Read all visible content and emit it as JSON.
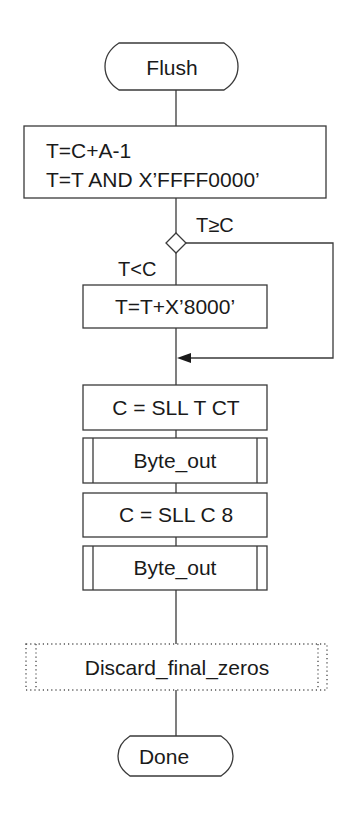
{
  "flowchart": {
    "start": {
      "label": "Flush",
      "shape": "terminator"
    },
    "init_process": {
      "lines": [
        "T=C+A-1",
        "T=T AND X’FFFF0000’"
      ],
      "shape": "process"
    },
    "decision": {
      "shape": "diamond",
      "branch_right_label": "T≥C",
      "branch_down_label": "T<C"
    },
    "add_process": {
      "label": "T=T+X’8000’",
      "shape": "process"
    },
    "shift_ct_process": {
      "label": "C = SLL T CT",
      "shape": "process"
    },
    "byte_out_1": {
      "label": "Byte_out",
      "shape": "predefined-process"
    },
    "shift_8_process": {
      "label": "C = SLL C 8",
      "shape": "process"
    },
    "byte_out_2": {
      "label": "Byte_out",
      "shape": "predefined-process"
    },
    "discard": {
      "label": "Discard_final_zeros",
      "shape": "predefined-process-dotted"
    },
    "end": {
      "label": "Done",
      "shape": "terminator"
    }
  },
  "colors": {
    "stroke": "#3a3a3a",
    "text": "#1a1a1a",
    "background": "#ffffff"
  }
}
